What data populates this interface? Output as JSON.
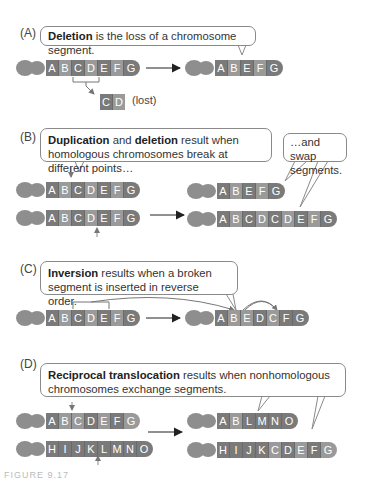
{
  "panels": [
    {
      "id": "A",
      "label": "(A)",
      "bubble_bold": "Deletion",
      "bubble_text": " is the loss of a chromosome segment.",
      "before": [
        "A",
        "B",
        "C",
        "D",
        "E",
        "F",
        "G"
      ],
      "after": [
        "A",
        "B",
        "E",
        "F",
        "G"
      ],
      "lost_segments": [
        "C",
        "D"
      ],
      "lost_label": "(lost)"
    },
    {
      "id": "B",
      "label": "(B)",
      "bubble_bold1": "Duplication",
      "bubble_mid": " and ",
      "bubble_bold2": "deletion",
      "bubble_text": " result when homologous chromosomes break at different points…",
      "bubble2_text": "…and swap segments.",
      "before_top": [
        "A",
        "B",
        "C",
        "D",
        "E",
        "F",
        "G"
      ],
      "before_bottom": [
        "A",
        "B",
        "C",
        "D",
        "E",
        "F",
        "G"
      ],
      "after_top": [
        "A",
        "B",
        "E",
        "F",
        "G"
      ],
      "after_bottom": [
        "A",
        "B",
        "C",
        "D",
        "C",
        "D",
        "E",
        "F",
        "G"
      ]
    },
    {
      "id": "C",
      "label": "(C)",
      "bubble_bold": "Inversion",
      "bubble_text": " results when a broken segment is inserted in reverse order.",
      "before": [
        "A",
        "B",
        "C",
        "D",
        "E",
        "F",
        "G"
      ],
      "after": [
        "A",
        "B",
        "E",
        "D",
        "C",
        "F",
        "G"
      ]
    },
    {
      "id": "D",
      "label": "(D)",
      "bubble_bold": "Reciprocal translocation",
      "bubble_text": " results when nonhomologous chromosomes exchange segments.",
      "before_top": [
        "A",
        "B",
        "C",
        "D",
        "E",
        "F",
        "G"
      ],
      "before_bottom": [
        "H",
        "I",
        "J",
        "K",
        "L",
        "M",
        "N",
        "O"
      ],
      "after_top": [
        "A",
        "B",
        "L",
        "M",
        "N",
        "O"
      ],
      "after_bottom": [
        "H",
        "I",
        "J",
        "K",
        "C",
        "D",
        "E",
        "F",
        "G"
      ]
    }
  ],
  "caption": "FIGURE 9.17"
}
